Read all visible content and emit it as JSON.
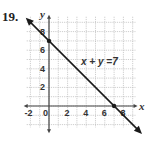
{
  "problem_number": "19.",
  "chart_data": {
    "type": "line",
    "title": "",
    "xlabel": "x",
    "ylabel": "y",
    "x_ticks": [
      "-2",
      "0",
      "2",
      "4",
      "6",
      "8"
    ],
    "y_ticks": [
      "2",
      "4",
      "6",
      "8"
    ],
    "xlim": [
      -2,
      9
    ],
    "ylim": [
      -2,
      9
    ],
    "grid": true,
    "series": [
      {
        "name": "x + y =7",
        "equation": "x + y = 7",
        "x": [
          -2.5,
          0,
          7,
          10
        ],
        "y": [
          9.5,
          7,
          0,
          -3
        ]
      }
    ],
    "points": [
      {
        "x": 0,
        "y": 7
      },
      {
        "x": 7,
        "y": 0
      }
    ],
    "annotations": [
      {
        "text": "x + y =7",
        "x": 4,
        "y": 4.5
      }
    ]
  }
}
